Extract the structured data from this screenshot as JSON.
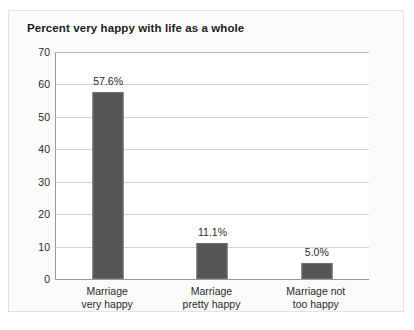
{
  "figure": {
    "title": "Percent very happy with life as a whole",
    "background_color": "#fbfbfb",
    "border_color": "#e3e3e3"
  },
  "chart_data": {
    "type": "bar",
    "title": "Percent very happy with life as a whole",
    "xlabel": "",
    "ylabel": "",
    "ylim": [
      0,
      70
    ],
    "ytick_step": 10,
    "yticks": [
      "70",
      "60",
      "50",
      "40",
      "30",
      "20",
      "10",
      "0"
    ],
    "grid": true,
    "legend": false,
    "bar_color": "#565656",
    "categories": [
      "Marriage very happy",
      "Marriage pretty happy",
      "Marriage not too happy"
    ],
    "category_lines": [
      [
        "Marriage",
        "very happy"
      ],
      [
        "Marriage",
        "pretty happy"
      ],
      [
        "Marriage not",
        "too happy"
      ]
    ],
    "values": [
      57.6,
      11.1,
      5.0
    ],
    "data_labels": [
      "57.6%",
      "11.1%",
      "5.0%"
    ]
  }
}
